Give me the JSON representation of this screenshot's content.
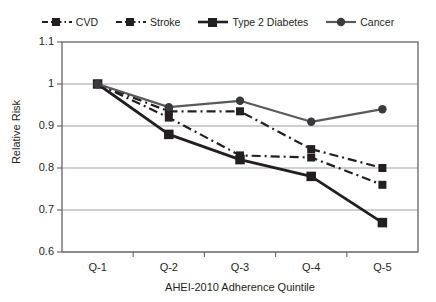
{
  "chart_data": {
    "type": "line",
    "title": "",
    "xlabel": "AHEI-2010 Adherence Quintile",
    "ylabel": "Relative Risk",
    "categories": [
      "Q-1",
      "Q-2",
      "Q-3",
      "Q-4",
      "Q-5"
    ],
    "ylim": [
      0.6,
      1.1
    ],
    "yticks": [
      "0.6",
      "0.7",
      "0.8",
      "0.9",
      "1",
      "1.1"
    ],
    "ytick_values": [
      0.6,
      0.7,
      0.8,
      0.9,
      1.0,
      1.1
    ],
    "grid": "horizontal",
    "legend_position": "top",
    "series": [
      {
        "name": "CVD",
        "values": [
          1.0,
          0.935,
          0.935,
          0.845,
          0.8
        ],
        "line_style": "dash-dot",
        "marker": "square",
        "color": "#231f20"
      },
      {
        "name": "Stroke",
        "values": [
          1.0,
          0.92,
          0.83,
          0.825,
          0.76
        ],
        "line_style": "dash-dot",
        "marker": "square",
        "color": "#231f20"
      },
      {
        "name": "Type 2 Diabetes",
        "values": [
          1.0,
          0.88,
          0.82,
          0.78,
          0.67
        ],
        "line_style": "solid",
        "marker": "square",
        "color": "#231f20"
      },
      {
        "name": "Cancer",
        "values": [
          1.0,
          0.945,
          0.96,
          0.91,
          0.94
        ],
        "line_style": "solid",
        "marker": "circle",
        "color": "#58595b"
      }
    ]
  },
  "legend": {
    "items": [
      {
        "label": "CVD"
      },
      {
        "label": "Stroke"
      },
      {
        "label": "Type 2 Diabetes"
      },
      {
        "label": "Cancer"
      }
    ]
  },
  "axes": {
    "x_label": "AHEI-2010 Adherence Quintile",
    "y_label": "Relative Risk",
    "x_ticks": [
      "Q-1",
      "Q-2",
      "Q-3",
      "Q-4",
      "Q-5"
    ],
    "y_ticks": [
      "1.1",
      "1",
      "0.9",
      "0.8",
      "0.7",
      "0.6"
    ]
  },
  "colors": {
    "dark": "#231f20",
    "gray": "#58595b",
    "grid": "#9d9fa2",
    "frame": "#6d6e71",
    "background": "#ffffff"
  }
}
